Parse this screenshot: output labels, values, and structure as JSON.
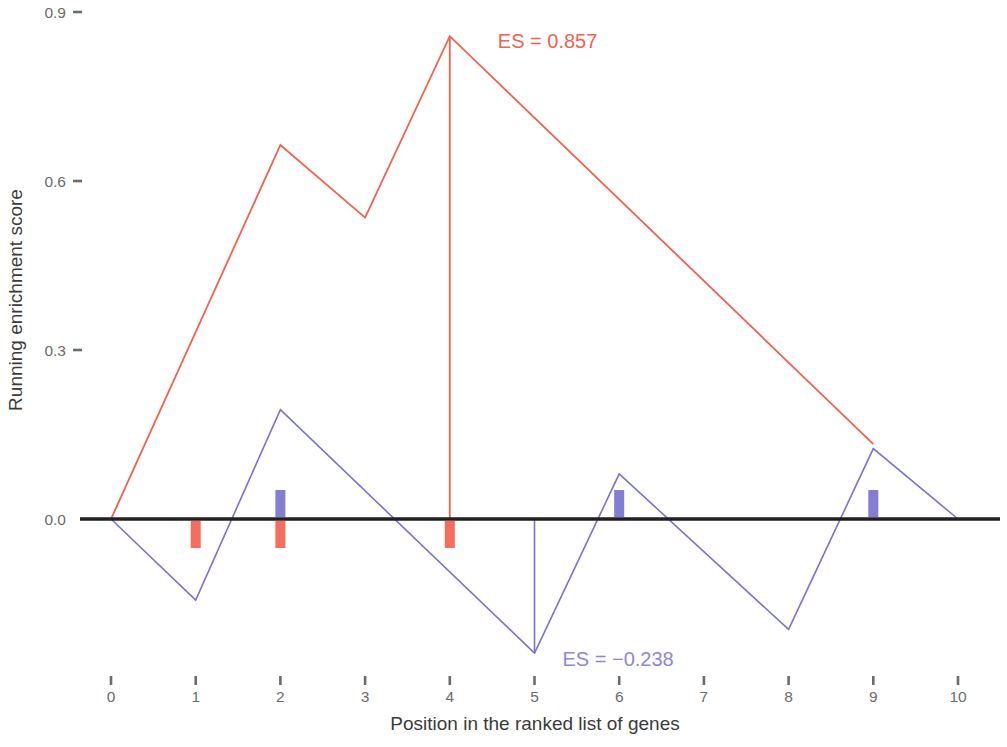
{
  "figure": {
    "kind": "gsea-running-enrichment-plot",
    "width": 1007,
    "height": 747,
    "background": "#ffffff"
  },
  "axes": {
    "x": {
      "title": "Position in the ranked list of genes",
      "ticks": [
        "0",
        "1",
        "2",
        "3",
        "4",
        "5",
        "6",
        "7",
        "8",
        "9",
        "10"
      ],
      "range": [
        0,
        10
      ]
    },
    "y": {
      "title": "Running enrichment score",
      "ticks": [
        "0.9",
        "0.6",
        "0.3",
        "0.0"
      ],
      "tick_values": [
        0.9,
        0.6,
        0.3,
        0.0
      ],
      "range": [
        -0.3,
        0.9
      ]
    }
  },
  "annotations": {
    "positive": {
      "text": "ES = 0.857",
      "color": "#f4614f"
    },
    "negative": {
      "text": "ES = −0.238",
      "color": "#8d86dd"
    }
  },
  "colors": {
    "positive_set": "#f4614f",
    "negative_set": "#7a72d0",
    "zero_line": "#231f20",
    "tick_text": "#6b6b6b",
    "axis_text": "#3b3b3b"
  },
  "chart_data": {
    "type": "line",
    "title": "",
    "xlabel": "Position in the ranked list of genes",
    "ylabel": "Running enrichment score",
    "xlim": [
      0,
      10
    ],
    "ylim": [
      -0.3,
      0.9
    ],
    "xticks": [
      0,
      1,
      2,
      3,
      4,
      5,
      6,
      7,
      8,
      9,
      10
    ],
    "yticks": [
      0.0,
      0.3,
      0.6,
      0.9
    ],
    "grid": false,
    "legend": "none",
    "series": [
      {
        "name": "positive gene set",
        "color": "#f4614f",
        "enrichment_score": 0.857,
        "es_label": "ES = 0.857",
        "x": [
          0,
          2,
          3,
          4,
          9
        ],
        "y": [
          0.0,
          0.664,
          0.535,
          0.857,
          0.133
        ],
        "peak_drop_line": {
          "x": 4,
          "y_from": 0.857,
          "y_to": 0.0
        },
        "hits": [
          1,
          2,
          4
        ],
        "hit_side": "below"
      },
      {
        "name": "negative gene set",
        "color": "#7a72d0",
        "enrichment_score": -0.238,
        "es_label": "ES = −0.238",
        "x": [
          0,
          1,
          2,
          5,
          6,
          8,
          9,
          10
        ],
        "y": [
          0.0,
          -0.144,
          0.194,
          -0.238,
          0.08,
          -0.196,
          0.125,
          0.0
        ],
        "peak_drop_line": {
          "x": 5,
          "y_from": 0.0,
          "y_to": -0.238
        },
        "hits": [
          2,
          6,
          9
        ],
        "hit_side": "above"
      }
    ],
    "zero_line": 0.0
  }
}
